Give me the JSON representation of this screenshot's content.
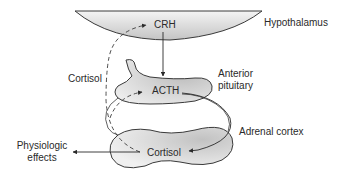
{
  "diagram": {
    "organs": {
      "hypothalamus": "Hypothalamus",
      "anterior_pituitary_line1": "Anterior",
      "anterior_pituitary_line2": "pituitary",
      "adrenal_cortex": "Adrenal cortex"
    },
    "hormones": {
      "crh": "CRH",
      "acth": "ACTH",
      "cortisol_product": "Cortisol",
      "cortisol_feedback": "Cortisol"
    },
    "outputs": {
      "physiologic_line1": "Physiologic",
      "physiologic_line2": "effects"
    },
    "colors": {
      "stroke": "#3a3a3a",
      "fill_light": "#f2f2f2",
      "fill_dark": "#c8c8c8"
    }
  }
}
